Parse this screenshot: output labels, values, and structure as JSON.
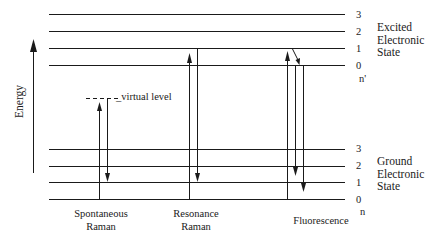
{
  "diagram": {
    "axis_label": "Energy",
    "virtual_level_label": "_virtual level",
    "excited_state": {
      "label_lines": [
        "Excited",
        "Electronic",
        "State"
      ],
      "levels": [
        "3",
        "2",
        "1",
        "0"
      ],
      "quantum_label": "n'"
    },
    "ground_state": {
      "label_lines": [
        "Ground",
        "Electronic",
        "State"
      ],
      "levels": [
        "3",
        "2",
        "1",
        "0"
      ],
      "quantum_label": "n"
    },
    "processes": [
      {
        "lines": [
          "Spontaneous",
          "Raman"
        ]
      },
      {
        "lines": [
          "Resonance",
          "Raman"
        ]
      },
      {
        "lines": [
          "Fluorescence"
        ]
      }
    ],
    "colors": {
      "line": "#1a1a1a",
      "background": "#ffffff"
    }
  }
}
